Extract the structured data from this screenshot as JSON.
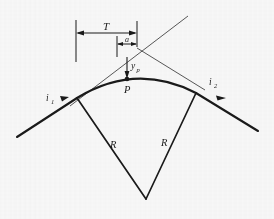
{
  "figure": {
    "kind": "engineering-diagram",
    "width": 274,
    "height": 219,
    "background_color": "#f8f8f8",
    "ink_color": "#1a1a1a"
  },
  "labels": {
    "tangent_length": "T",
    "offset_a": "a",
    "mid_ordinate": "y",
    "mid_ordinate_sub": "p",
    "point_p": "P",
    "grade_in": "i",
    "grade_in_sub": "1",
    "grade_out": "i",
    "grade_out_sub": "2",
    "radius_left": "R",
    "radius_right": "R"
  },
  "geometry": {
    "pvi": {
      "x": 137,
      "y": 48
    },
    "bvc": {
      "x": 77,
      "y": 98
    },
    "evc": {
      "x": 196,
      "y": 93
    },
    "apex": {
      "x": 132,
      "y": 78
    },
    "point_p": {
      "x": 127,
      "y": 79
    },
    "center": {
      "x": 146,
      "y": 199
    },
    "tangent_left_start": {
      "x": 17,
      "y": 137
    },
    "tangent_right_end": {
      "x": 258,
      "y": 131
    },
    "tangent_up_left_end": {
      "x": 70,
      "y": 106
    },
    "tangent_up_right_end": {
      "x": 188,
      "y": 16
    },
    "dim_line_y": 33,
    "dim_a_line_y": 44,
    "ext_left_x": 76,
    "ext_left_top": 20,
    "ext_left_bottom": 62,
    "ext_a_x": 117,
    "ext_a_top": 36,
    "ext_a_bottom": 57,
    "ext_pvi_x": 137,
    "ext_pvi_top": 21,
    "ext_pvi_bottom": 47
  },
  "dimensions": {
    "T_from_x": 76,
    "T_to_x": 137,
    "a_from_x": 117,
    "a_to_x": 137
  }
}
